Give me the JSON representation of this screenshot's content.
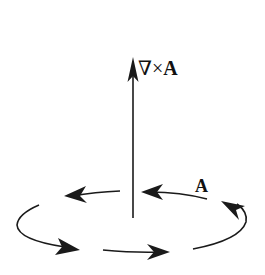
{
  "diagram": {
    "labels": {
      "curl_nabla": "∇",
      "curl_times": "×",
      "curl_A": "A",
      "vector_field": "A"
    },
    "elements": {
      "axis_arrow": "vertical arrow representing curl of A",
      "circulation_arrows": 5
    },
    "colors": {
      "stroke": "#1a1a1a",
      "background": "#ffffff"
    }
  }
}
